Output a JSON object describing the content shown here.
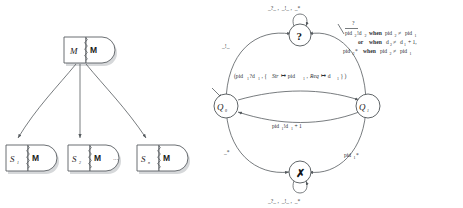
{
  "figure_left": {
    "name": "component-hierarchy-diagram",
    "root_node": {
      "id": "root",
      "state_label": "M",
      "port_label": "M"
    },
    "child_nodes": [
      {
        "id": "s1",
        "state_label": "S",
        "state_sub": "1",
        "port_label": "M"
      },
      {
        "id": "s2",
        "state_label": "S",
        "state_sub": "2",
        "port_label": "M"
      },
      {
        "id": "sn",
        "state_label": "S",
        "state_sub": "n",
        "port_label": "M"
      }
    ],
    "ellipsis": "···"
  },
  "figure_right": {
    "name": "state-machine-diagram",
    "states": [
      {
        "id": "q0",
        "label": "Q",
        "sub": "0"
      },
      {
        "id": "q1",
        "label": "Q",
        "sub": "1"
      },
      {
        "id": "unknown",
        "glyph": "?"
      },
      {
        "id": "reject",
        "glyph": "✗"
      }
    ],
    "selfloop_top_label": "_?_ ,  _!_ ,  _*",
    "selfloop_bottom_label": "_?_ ,  _!_ ,  _*",
    "edge_q0_to_unknown_label": "_!_",
    "edge_q0_to_reject_label": "_*",
    "edge_q1_to_reject_label": "pid",
    "edge_q1_to_reject_sub": "1",
    "edge_q1_to_reject_tail": "*",
    "edge_q0_to_q1_label_parts": {
      "open": "(pid",
      "sub1": "1",
      "recv": "?d",
      "sub2": "1",
      "mid": " , { ",
      "str": "Str",
      "maps1": " ↦ pid",
      "sub3": "1",
      "sep": " , ",
      "req": "Req",
      "maps2": " ↦ d",
      "sub4": "1",
      "close": " } )"
    },
    "edge_q1_to_q0_label_parts": {
      "head": "pid",
      "sub1": "1",
      "send": "!d",
      "sub2": "1",
      "tail": " + 1"
    },
    "guard_block": {
      "line1_overline": "?",
      "line1": "pid₂2̄!d₂2  when  pid₂2 ≠ pid₂1",
      "line1_parts": {
        "pid2": "pid",
        "s2": "2",
        "send": "!d",
        "s2b": "2",
        "when": "when",
        "cmp_a": "pid",
        "s2c": "2",
        "neq": "≠",
        "cmp_b": "pid",
        "s1": "1"
      },
      "line2_parts": {
        "or": "or",
        "when": "when",
        "d2": "d",
        "s2": "2",
        "neq": "≠",
        "d1": "d",
        "s1": "1",
        "plus": " + 1,"
      },
      "line3_parts": {
        "pid2": "pid",
        "s2": "2",
        "star": "*",
        "when": "when",
        "cmp_a": "pid",
        "s2b": "2",
        "neq": "≠",
        "cmp_b": "pid",
        "s1": "1"
      }
    }
  },
  "colors": {
    "ink": "#2b2f33",
    "stroke": "#555a5e",
    "shadow": "#d6d8da",
    "background": "#ffffff"
  }
}
